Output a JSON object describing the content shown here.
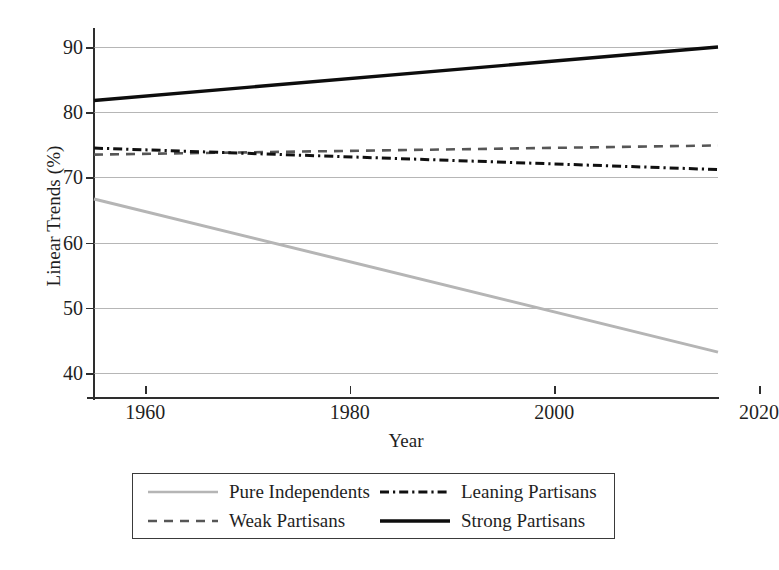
{
  "chart_data": {
    "type": "line",
    "title": "",
    "xlabel": "Year",
    "ylabel": "Linear Trends (%)",
    "xlim": [
      1955,
      2016
    ],
    "ylim": [
      38,
      92
    ],
    "xticks": [
      1960,
      1980,
      2000,
      2020
    ],
    "yticks": [
      40,
      50,
      60,
      70,
      80,
      90
    ],
    "grid": true,
    "legend_position": "below-center",
    "x": [
      1955,
      2016
    ],
    "series": [
      {
        "name": "Pure Independents",
        "values": [
          66.7,
          43.2
        ],
        "color": "#b5b5b5",
        "dash": "solid",
        "width": 3.0
      },
      {
        "name": "Weak Partisans",
        "values": [
          73.5,
          74.9
        ],
        "color": "#565656",
        "dash": "dashed",
        "width": 2.6
      },
      {
        "name": "Leaning Partisans",
        "values": [
          74.5,
          71.2
        ],
        "color": "#101010",
        "dash": "dashdot",
        "width": 3.0
      },
      {
        "name": "Strong Partisans",
        "values": [
          81.8,
          90.0
        ],
        "color": "#0d0d0d",
        "dash": "solid",
        "width": 3.4
      }
    ]
  },
  "axes": {
    "ylabel": "Linear Trends (%)",
    "xlabel": "Year",
    "ytick_labels": [
      "90",
      "80",
      "70",
      "60",
      "50",
      "40"
    ],
    "xtick_labels": [
      "1960",
      "1980",
      "2000",
      "2020"
    ]
  },
  "legend": {
    "entries": [
      {
        "label": "Pure Independents",
        "swatch": "line-solid-gray"
      },
      {
        "label": "Leaning Partisans",
        "swatch": "line-dashdot-black"
      },
      {
        "label": "Weak Partisans",
        "swatch": "line-dashed-gray"
      },
      {
        "label": "Strong Partisans",
        "swatch": "line-solid-black"
      }
    ]
  },
  "colors": {
    "grid": "#9a9a9a",
    "axis": "#2e2e2e",
    "text": "#1f1f1f",
    "background": "#ffffff"
  }
}
